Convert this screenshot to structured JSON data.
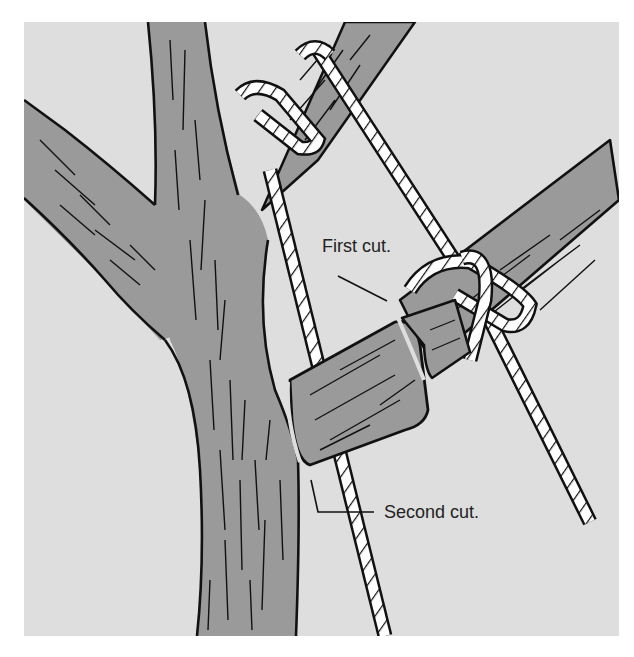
{
  "illustration": {
    "subject": "Tree limb removal using rope, showing cut locations",
    "labels": {
      "first_cut": "First cut.",
      "second_cut": "Second cut."
    },
    "colors": {
      "background": "#ffffff",
      "panel": "#dedede",
      "bark": "#9a9a9a",
      "outline": "#111111",
      "rope": "#ffffff"
    }
  }
}
